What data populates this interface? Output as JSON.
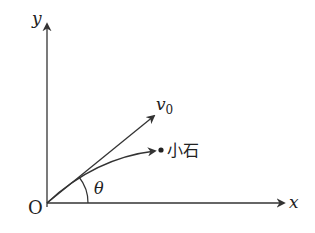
{
  "diagram": {
    "type": "projectile-motion",
    "labels": {
      "y_axis": "y",
      "x_axis": "x",
      "origin": "O",
      "velocity": "v",
      "velocity_subscript": "0",
      "stone": "小石",
      "angle": "θ"
    },
    "colors": {
      "stroke": "#333333",
      "text": "#222222",
      "background": "#ffffff"
    }
  }
}
